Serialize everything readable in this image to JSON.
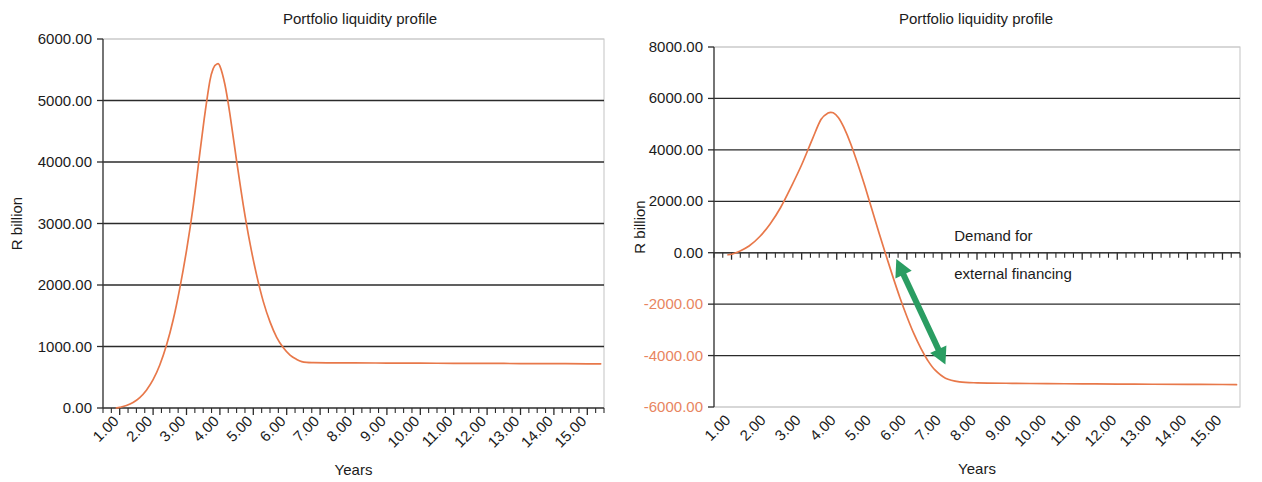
{
  "figure": {
    "width": 1262,
    "height": 482,
    "background": "#ffffff",
    "bottom_fragment": "",
    "series_color": "#e8784a",
    "annotation_color": "#2a9d62",
    "gridline_color": "#2b2b2b",
    "axis_color": "#3a3a3a"
  },
  "chart_data": [
    {
      "id": "left",
      "type": "line",
      "title": "Portfolio liquidity profile",
      "xlabel": "Years",
      "ylabel": "R billion",
      "xlim": [
        0.5,
        15.5
      ],
      "ylim": [
        0,
        6000
      ],
      "ytick_labels": [
        "0.00",
        "1000.00",
        "2000.00",
        "3000.00",
        "4000.00",
        "5000.00",
        "6000.00"
      ],
      "ytick_values": [
        0,
        1000,
        2000,
        3000,
        4000,
        5000,
        6000
      ],
      "xtick_labels": [
        "1.00",
        "2.00",
        "3.00",
        "4.00",
        "5.00",
        "6.00",
        "7.00",
        "8.00",
        "9.00",
        "10.00",
        "11.00",
        "12.00",
        "13.00",
        "14.00",
        "15.00"
      ],
      "xtick_values": [
        1,
        2,
        3,
        4,
        5,
        6,
        7,
        8,
        9,
        10,
        11,
        12,
        13,
        14,
        15
      ],
      "grid": "horizontal",
      "legend": "none",
      "series": [
        {
          "name": "Portfolio liquidity",
          "color": "#e8784a",
          "x": [
            0.9,
            1.0,
            1.2,
            1.4,
            1.6,
            1.8,
            2.0,
            2.2,
            2.4,
            2.6,
            2.8,
            3.0,
            3.2,
            3.4,
            3.55,
            3.7,
            3.8,
            3.9,
            4.0,
            4.15,
            4.3,
            4.5,
            4.7,
            4.9,
            5.1,
            5.3,
            5.5,
            5.7,
            5.9,
            6.1,
            6.3,
            6.45,
            6.6,
            6.8,
            7.2,
            8.0,
            9.0,
            10.0,
            11.0,
            12.0,
            13.0,
            14.0,
            15.0,
            15.4
          ],
          "y": [
            0,
            10,
            40,
            90,
            170,
            290,
            460,
            700,
            1020,
            1430,
            1950,
            2560,
            3280,
            4150,
            4780,
            5320,
            5520,
            5590,
            5560,
            5260,
            4780,
            4020,
            3300,
            2680,
            2160,
            1730,
            1400,
            1150,
            980,
            860,
            790,
            755,
            742,
            738,
            735,
            733,
            731,
            729,
            727,
            725,
            723,
            721,
            719,
            718
          ]
        }
      ],
      "annotations": []
    },
    {
      "id": "right",
      "type": "line",
      "title": "Portfolio liquidity profile",
      "xlabel": "Years",
      "ylabel": "R billion",
      "xlim": [
        0.5,
        15.5
      ],
      "ylim": [
        -6000,
        8000
      ],
      "ytick_labels": [
        "-6000.00",
        "-4000.00",
        "-2000.00",
        "0.00",
        "2000.00",
        "4000.00",
        "6000.00",
        "8000.00"
      ],
      "ytick_values": [
        -6000,
        -4000,
        -2000,
        0,
        2000,
        4000,
        6000,
        8000
      ],
      "xtick_labels": [
        "1.00",
        "2.00",
        "3.00",
        "4.00",
        "5.00",
        "6.00",
        "7.00",
        "8.00",
        "9.00",
        "10.00",
        "11.00",
        "12.00",
        "13.00",
        "14.00",
        "15.00"
      ],
      "xtick_values": [
        1,
        2,
        3,
        4,
        5,
        6,
        7,
        8,
        9,
        10,
        11,
        12,
        13,
        14,
        15
      ],
      "grid": "horizontal",
      "legend": "none",
      "series": [
        {
          "name": "Portfolio liquidity",
          "color": "#e8784a",
          "x": [
            0.9,
            1.0,
            1.2,
            1.5,
            1.8,
            2.1,
            2.4,
            2.7,
            3.0,
            3.3,
            3.55,
            3.75,
            3.9,
            4.05,
            4.2,
            4.4,
            4.6,
            4.8,
            5.0,
            5.2,
            5.4,
            5.6,
            5.8,
            6.0,
            6.2,
            6.4,
            6.6,
            6.8,
            7.1,
            7.5,
            8.0,
            9.0,
            10.0,
            11.0,
            12.0,
            13.0,
            14.0,
            15.0,
            15.4
          ],
          "y": [
            -80,
            -60,
            40,
            260,
            620,
            1120,
            1760,
            2560,
            3420,
            4400,
            5180,
            5430,
            5440,
            5250,
            4880,
            4230,
            3450,
            2600,
            1700,
            800,
            -80,
            -930,
            -1740,
            -2480,
            -3150,
            -3720,
            -4200,
            -4560,
            -4880,
            -5020,
            -5060,
            -5080,
            -5090,
            -5100,
            -5110,
            -5115,
            -5120,
            -5125,
            -5130
          ]
        }
      ],
      "annotations": [
        {
          "id": "demand-annotation",
          "line1": "Demand for",
          "line2": "external financing",
          "color": "#1b1b1b"
        },
        {
          "id": "demand-arrow",
          "type": "double-headed-arrow",
          "color": "#2a9d62",
          "from_year": 5.7,
          "from_value": -250,
          "to_year": 7.1,
          "to_value": -4350
        }
      ]
    }
  ]
}
